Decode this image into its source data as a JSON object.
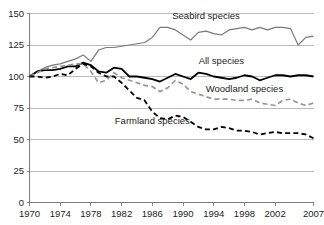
{
  "chart_data": {
    "type": "line",
    "title": "",
    "subtitle": "",
    "xlabel": "",
    "ylabel": "",
    "xlim": [
      1970,
      2007
    ],
    "ylim": [
      0,
      150
    ],
    "grid": true,
    "legend_position": "inline-annotations",
    "y_ticks": [
      0,
      25,
      50,
      75,
      100,
      125,
      150
    ],
    "x_ticks": [
      1970,
      1974,
      1978,
      1982,
      1986,
      1990,
      1994,
      1998,
      2002,
      2007
    ],
    "x": [
      1970,
      1971,
      1972,
      1973,
      1974,
      1975,
      1976,
      1977,
      1978,
      1979,
      1980,
      1981,
      1982,
      1983,
      1984,
      1985,
      1986,
      1987,
      1988,
      1989,
      1990,
      1991,
      1992,
      1993,
      1994,
      1995,
      1996,
      1997,
      1998,
      1999,
      2000,
      2001,
      2002,
      2003,
      2004,
      2005,
      2006,
      2007
    ],
    "series": [
      {
        "name": "Seabird species",
        "style": "solid-grey",
        "color": "#7a7a7a",
        "label_x": 1993,
        "label_y": 146,
        "values": [
          100,
          104,
          107,
          109,
          110,
          112,
          114,
          117,
          112,
          121,
          123,
          123,
          124,
          125,
          126,
          127,
          131,
          139,
          139,
          137,
          133,
          129,
          135,
          136,
          134,
          133,
          137,
          138,
          139,
          137,
          139,
          137,
          139,
          139,
          138,
          125,
          131,
          132
        ]
      },
      {
        "name": "All species",
        "style": "solid-black",
        "color": "#000000",
        "label_x": 1995,
        "label_y": 110,
        "values": [
          100,
          104,
          105,
          105,
          106,
          108,
          108,
          111,
          109,
          104,
          103,
          107,
          106,
          100,
          100,
          99,
          98,
          96,
          99,
          102,
          100,
          98,
          103,
          102,
          100,
          99,
          98,
          99,
          101,
          100,
          97,
          99,
          101,
          101,
          100,
          101,
          101,
          100
        ]
      },
      {
        "name": "Woodland species",
        "style": "dashed-grey",
        "color": "#969696",
        "label_x": 1998,
        "label_y": 88,
        "values": [
          100,
          103,
          106,
          107,
          108,
          109,
          110,
          110,
          104,
          95,
          97,
          103,
          99,
          97,
          95,
          93,
          92,
          88,
          91,
          97,
          94,
          88,
          86,
          84,
          82,
          82,
          82,
          81,
          81,
          82,
          79,
          78,
          77,
          81,
          82,
          79,
          77,
          79
        ]
      },
      {
        "name": "Farmland species",
        "style": "dashed-black",
        "color": "#000000",
        "label_x": 1986,
        "label_y": 62,
        "values": [
          100,
          100,
          99,
          100,
          102,
          101,
          106,
          110,
          108,
          103,
          100,
          100,
          95,
          89,
          83,
          81,
          72,
          67,
          66,
          69,
          68,
          64,
          60,
          58,
          58,
          60,
          59,
          57,
          57,
          56,
          54,
          55,
          56,
          55,
          55,
          55,
          54,
          51
        ]
      }
    ]
  }
}
